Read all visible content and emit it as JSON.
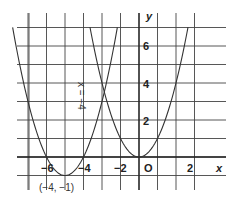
{
  "chart_data": {
    "type": "line",
    "title": "",
    "xlabel": "x",
    "ylabel": "y",
    "xlim": [
      -7,
      3
    ],
    "ylim": [
      -1,
      7
    ],
    "grid": true,
    "origin_label": "O",
    "x_tick_labels": [
      "-6",
      "-4",
      "-2",
      "2"
    ],
    "x_tick_values": [
      -6,
      -4,
      -2,
      2
    ],
    "y_tick_labels": [
      "2",
      "4",
      "6"
    ],
    "y_tick_values": [
      2,
      4,
      6
    ],
    "series": [
      {
        "name": "y = x^2",
        "equation": "y = x²",
        "vertex": [
          0,
          0
        ],
        "x": [
          -2.65,
          -2,
          -1,
          0,
          1,
          2,
          2.65
        ],
        "y": [
          7,
          4,
          1,
          0,
          1,
          4,
          7
        ]
      },
      {
        "name": "y = (x + 4)^2 - 1",
        "equation": "y = (x+4)² − 1",
        "vertex": [
          -4,
          -1
        ],
        "x": [
          -6.83,
          -6,
          -5,
          -4,
          -3,
          -2,
          -1.17
        ],
        "y": [
          7,
          3,
          0,
          -1,
          0,
          3,
          7
        ]
      }
    ],
    "annotations": [
      {
        "text": "x = −4",
        "position": [
          -3.2,
          5
        ],
        "rotation": 90,
        "meaning": "axis of symmetry"
      },
      {
        "text": "(−4, −1)",
        "position": [
          -4.3,
          -1.3
        ],
        "meaning": "vertex label"
      }
    ]
  },
  "labels": {
    "x_axis": "x",
    "y_axis": "y",
    "origin": "O",
    "symmetry": "x = −4",
    "vertex": "(−4, −1)",
    "xt_m6": "−6",
    "xt_m4": "−4",
    "xt_m2": "−2",
    "xt_2": "2",
    "yt_2": "2",
    "yt_4": "4",
    "yt_6": "6"
  }
}
